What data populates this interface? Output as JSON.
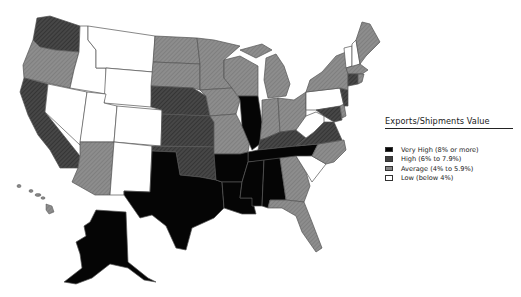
{
  "legend": {
    "title": "Exports/Shipments Value",
    "items": [
      {
        "key": "very_high",
        "label": "Very High (8% or more)",
        "color": "#050505"
      },
      {
        "key": "high",
        "label": "High (6% to 7.9%)",
        "color": "#3f3f3f"
      },
      {
        "key": "average",
        "label": "Average (4% to 5.9%)",
        "color": "#858585"
      },
      {
        "key": "low",
        "label": "Low (below 4%)",
        "color": "#ffffff"
      }
    ]
  },
  "states": {
    "very_high": [
      "Illinois",
      "Texas",
      "Louisiana",
      "Arkansas",
      "Mississippi",
      "Alabama",
      "Tennessee",
      "Alaska"
    ],
    "high": [
      "Washington",
      "California",
      "Nebraska",
      "Kansas",
      "Oklahoma",
      "Kentucky",
      "Virginia",
      "Maryland",
      "Connecticut",
      "New Jersey"
    ],
    "average": [
      "Oregon",
      "Arizona",
      "North Dakota",
      "South Dakota",
      "Minnesota",
      "Iowa",
      "Missouri",
      "Wisconsin",
      "Michigan",
      "Indiana",
      "Ohio",
      "New York",
      "Maine",
      "Massachusetts",
      "Rhode Island",
      "North Carolina",
      "Georgia",
      "Florida",
      "Hawaii",
      "Delaware"
    ],
    "low": [
      "Idaho",
      "Montana",
      "Wyoming",
      "Nevada",
      "Utah",
      "Colorado",
      "New Mexico",
      "Pennsylvania",
      "West Virginia",
      "South Carolina",
      "Vermont",
      "New Hampshire"
    ]
  }
}
